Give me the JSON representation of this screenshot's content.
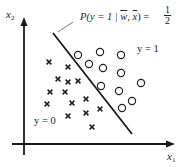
{
  "diagram": {
    "type": "logistic-regression-decision-boundary",
    "axes": {
      "x_label": "x",
      "x_sub": "1",
      "y_label": "x",
      "y_sub": "2"
    },
    "boundary_label": "P(y = 1 | w, x) = 1/2",
    "boundary_label_parts": {
      "lhs": "P(y = 1 | ",
      "w": "w",
      "comma": ", ",
      "x": "x",
      "rhs": ") = ",
      "num": "1",
      "den": "2"
    },
    "class_labels": {
      "positive": "y = 1",
      "negative": "y = 0"
    },
    "colors": {
      "ink": "#1a1a1a",
      "marker": "#222222"
    },
    "boundary_line": {
      "x1": 53,
      "y1": 33,
      "x2": 132,
      "y2": 134
    },
    "circles": [
      [
        78,
        55
      ],
      [
        100,
        52
      ],
      [
        121,
        55
      ],
      [
        89,
        64
      ],
      [
        103,
        68
      ],
      [
        121,
        73
      ],
      [
        101,
        86
      ],
      [
        119,
        91
      ],
      [
        141,
        83
      ],
      [
        132,
        101
      ],
      [
        122,
        108
      ]
    ],
    "crosses": [
      [
        49,
        62
      ],
      [
        68,
        67
      ],
      [
        58,
        79
      ],
      [
        68,
        82
      ],
      [
        78,
        81
      ],
      [
        50,
        92
      ],
      [
        65,
        92
      ],
      [
        47,
        104
      ],
      [
        72,
        103
      ],
      [
        86,
        99
      ],
      [
        68,
        116
      ],
      [
        86,
        113
      ],
      [
        100,
        109
      ],
      [
        92,
        127
      ]
    ]
  }
}
